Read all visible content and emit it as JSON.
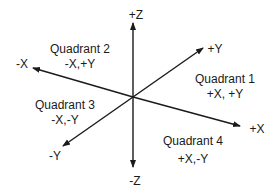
{
  "diagram": {
    "type": "3d-coordinate-axes",
    "colors": {
      "stroke": "#1a1a1a",
      "background": "#ffffff"
    },
    "axes": {
      "plus_z": "+Z",
      "minus_z": "-Z",
      "plus_x": "+X",
      "minus_x": "-X",
      "plus_y": "+Y",
      "minus_y": "-Y"
    },
    "quadrants": [
      {
        "title": "Quadrant 1",
        "signs": "+X, +Y"
      },
      {
        "title": "Quadrant 2",
        "signs": "-X,+Y"
      },
      {
        "title": "Quadrant 3",
        "signs": "-X,-Y"
      },
      {
        "title": "Quadrant 4",
        "signs": "+X,-Y"
      }
    ]
  }
}
